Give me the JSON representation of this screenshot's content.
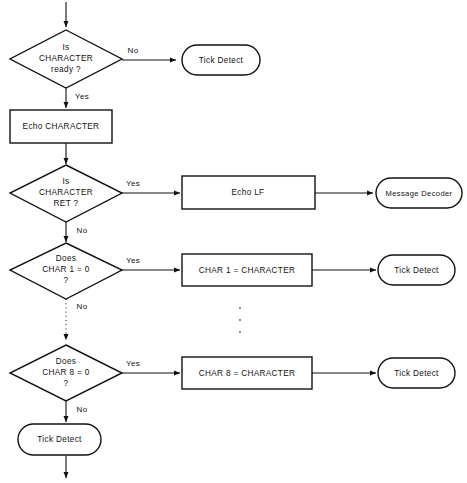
{
  "diagram": {
    "colors": {
      "stroke": "#111111",
      "background": "#ffffff",
      "text": "#111111"
    },
    "nodes": {
      "decision_char_ready": {
        "line1": "Is",
        "line2": "CHARACTER",
        "line3": "ready ?"
      },
      "terminator_tick_detect_1": {
        "label": "Tick Detect"
      },
      "process_echo_character": {
        "label": "Echo CHARACTER"
      },
      "decision_char_ret": {
        "line1": "Is",
        "line2": "CHARACTER",
        "line3": "RET ?"
      },
      "process_echo_lf": {
        "label": "Echo LF"
      },
      "terminator_message_decoder": {
        "label": "Message Decoder"
      },
      "decision_char1_zero": {
        "line1": "Does",
        "line2": "CHAR 1 = 0",
        "line3": "?"
      },
      "process_char1_assign": {
        "label": "CHAR 1 = CHARACTER"
      },
      "terminator_tick_detect_2": {
        "label": "Tick Detect"
      },
      "decision_char8_zero": {
        "line1": "Does",
        "line2": "CHAR 8 = 0",
        "line3": "?"
      },
      "process_char8_assign": {
        "label": "CHAR 8 = CHARACTER"
      },
      "terminator_tick_detect_3": {
        "label": "Tick Detect"
      },
      "terminator_tick_detect_exit": {
        "label": "Tick Detect"
      }
    },
    "edge_labels": {
      "char_ready_no": "No",
      "char_ready_yes": "Yes",
      "char_ret_yes": "Yes",
      "char_ret_no": "No",
      "char1_yes": "Yes",
      "char1_no": "No",
      "char8_yes": "Yes",
      "char8_no": "No"
    }
  }
}
